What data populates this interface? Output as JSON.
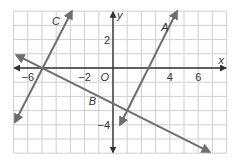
{
  "chart_data": {
    "type": "line",
    "title": "",
    "xlabel": "x",
    "ylabel": "y",
    "origin_label": "O",
    "xlim": [
      -7,
      8
    ],
    "ylim": [
      -6,
      4
    ],
    "grid": true,
    "x_tick_labels": [
      {
        "value": -6,
        "label": "−6"
      },
      {
        "value": -2,
        "label": "−2"
      },
      {
        "value": 4,
        "label": "4"
      },
      {
        "value": 6,
        "label": "6"
      }
    ],
    "y_tick_labels": [
      {
        "value": 2,
        "label": "2"
      },
      {
        "value": -4,
        "label": "−4"
      }
    ],
    "series": [
      {
        "name": "A",
        "equation": "y = 2x - 5",
        "slope": 2,
        "intercept": -5,
        "x": [
          0.5,
          4.5
        ],
        "y": [
          -4,
          4
        ],
        "label_pos": [
          3.4,
          2.6
        ]
      },
      {
        "name": "B",
        "equation": "y = -0.5x - 2.5",
        "slope": -0.5,
        "intercept": -2.5,
        "x": [
          -6.8,
          6.8
        ],
        "y": [
          0.9,
          -5.9
        ],
        "label_pos": [
          -1.7,
          -2.6
        ]
      },
      {
        "name": "C",
        "equation": "y = 2x + 10",
        "slope": 2,
        "intercept": 10,
        "x": [
          -6.9,
          -2.9
        ],
        "y": [
          -3.8,
          4.0
        ],
        "label_pos": [
          -4.3,
          3.0
        ]
      }
    ],
    "colors": {
      "lines": "#6e6e6e",
      "axes": "#333333",
      "grid": "#cfcfcf"
    }
  }
}
